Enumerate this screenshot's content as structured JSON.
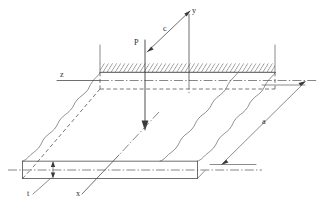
{
  "figure": {
    "labels": {
      "load": "P",
      "axis_y": "y",
      "axis_x": "x",
      "axis_z": "z",
      "distance_c": "c",
      "dimension_a": "a",
      "thickness_t": "t"
    },
    "colors": {
      "line": "#4a4a4a",
      "hatch": "#6a6a6a",
      "dashed": "#555555",
      "background": "#ffffff",
      "text": "#2e2e2e"
    },
    "elements": {
      "clamped_edge": "hatched-fixed-edge",
      "load_arrow": "downward-point-load-arrow",
      "break_lines": "wavy-break-edges",
      "center_lines": "dash-dot-axis-lines"
    }
  }
}
